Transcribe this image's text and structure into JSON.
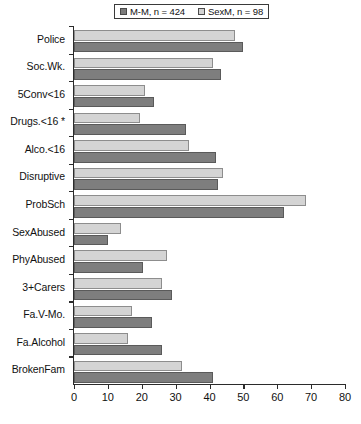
{
  "chart_data": {
    "type": "bar",
    "orientation": "horizontal",
    "title": "",
    "xlabel": "",
    "ylabel": "",
    "xlim": [
      0,
      80
    ],
    "xticks": [
      0,
      10,
      20,
      30,
      40,
      50,
      60,
      70,
      80
    ],
    "grid": false,
    "legend_position": "top",
    "categories": [
      "Police",
      "Soc.Wk.",
      "5Conv<16",
      "Drugs.<16 *",
      "Alco.<16",
      "Disruptive",
      "ProbSch",
      "SexAbused",
      "PhyAbused",
      "3+Carers",
      "Fa.V-Mo.",
      "Fa.Alcohol",
      "BrokenFam"
    ],
    "series": [
      {
        "name": "M-M, n = 424",
        "key": "mm",
        "color": "#7e7e7e",
        "values": [
          50,
          43.5,
          23.5,
          33,
          42,
          42.5,
          62,
          10,
          20.5,
          29,
          23,
          26,
          41
        ]
      },
      {
        "name": "SexM, n = 98",
        "key": "sexm",
        "color": "#d4d4d4",
        "values": [
          47.5,
          41,
          21,
          19.5,
          34,
          44,
          68.5,
          14,
          27.5,
          26,
          17,
          16,
          32
        ]
      }
    ]
  },
  "legend": {
    "entries": [
      {
        "label": "M-M, n = 424",
        "swatch": "dark"
      },
      {
        "label": "SexM, n = 98",
        "swatch": "light"
      }
    ]
  },
  "axes": {
    "x_tick_labels": [
      "0",
      "10",
      "20",
      "30",
      "40",
      "50",
      "60",
      "70",
      "80"
    ]
  }
}
